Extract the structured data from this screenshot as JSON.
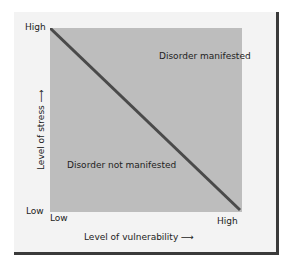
{
  "diagram": {
    "y_axis": {
      "label": "Level of stress",
      "high": "High",
      "low": "Low"
    },
    "x_axis": {
      "label": "Level of vulnerability",
      "low": "Low",
      "high": "High"
    },
    "regions": {
      "upper": "Disorder manifested",
      "lower": "Disorder not manifested"
    },
    "colors": {
      "plot_fill": "#bdbdbd",
      "line": "#4a4a4a",
      "card": "#f3f3f3"
    }
  }
}
